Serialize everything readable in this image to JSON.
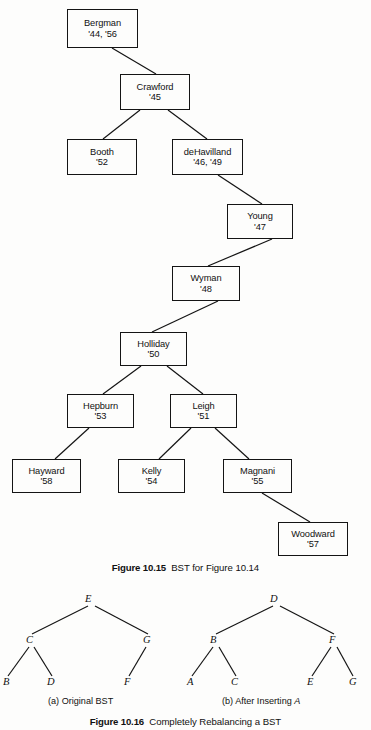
{
  "page": {
    "background_color": "#fdfdfc",
    "ink_color": "#141414",
    "width": 371,
    "height": 730
  },
  "figure_10_15": {
    "caption_label": "Figure 10.15",
    "caption_text": "BST for Figure 10.14",
    "nodes": [
      {
        "id": "bergman",
        "name": "Bergman",
        "years": "'44, '56",
        "x": 67,
        "y": 9,
        "w": 71,
        "h": 39
      },
      {
        "id": "crawford",
        "name": "Crawford",
        "years": "'45",
        "x": 120,
        "y": 74,
        "w": 70,
        "h": 36
      },
      {
        "id": "booth",
        "name": "Booth",
        "years": "'52",
        "x": 67,
        "y": 139,
        "w": 70,
        "h": 36
      },
      {
        "id": "dehavilland",
        "name": "deHavilland",
        "years": "'46, '49",
        "x": 172,
        "y": 139,
        "w": 71,
        "h": 36
      },
      {
        "id": "young",
        "name": "Young",
        "years": "'47",
        "x": 227,
        "y": 204,
        "w": 66,
        "h": 35
      },
      {
        "id": "wyman",
        "name": "Wyman",
        "years": "'48",
        "x": 172,
        "y": 266,
        "w": 68,
        "h": 35
      },
      {
        "id": "holliday",
        "name": "Holliday",
        "years": "'50",
        "x": 120,
        "y": 332,
        "w": 67,
        "h": 34
      },
      {
        "id": "hepburn",
        "name": "Hepburn",
        "years": "'53",
        "x": 67,
        "y": 394,
        "w": 67,
        "h": 34
      },
      {
        "id": "leigh",
        "name": "Leigh",
        "years": "'51",
        "x": 170,
        "y": 394,
        "w": 67,
        "h": 34
      },
      {
        "id": "hayward",
        "name": "Hayward",
        "years": "'58",
        "x": 12,
        "y": 459,
        "w": 69,
        "h": 34
      },
      {
        "id": "kelly",
        "name": "Kelly",
        "years": "'54",
        "x": 118,
        "y": 459,
        "w": 67,
        "h": 34
      },
      {
        "id": "magnani",
        "name": "Magnani",
        "years": "'55",
        "x": 223,
        "y": 459,
        "w": 69,
        "h": 34
      },
      {
        "id": "woodward",
        "name": "Woodward",
        "years": "'57",
        "x": 278,
        "y": 522,
        "w": 70,
        "h": 34
      }
    ],
    "edges": [
      {
        "from": "bergman",
        "to": "crawford",
        "x1": 112,
        "y1": 48,
        "x2": 156,
        "y2": 74
      },
      {
        "from": "crawford",
        "to": "booth",
        "x1": 140,
        "y1": 110,
        "x2": 103,
        "y2": 139
      },
      {
        "from": "crawford",
        "to": "dehavilland",
        "x1": 168,
        "y1": 110,
        "x2": 207,
        "y2": 139
      },
      {
        "from": "dehavilland",
        "to": "young",
        "x1": 218,
        "y1": 175,
        "x2": 262,
        "y2": 204
      },
      {
        "from": "young",
        "to": "wyman",
        "x1": 272,
        "y1": 239,
        "x2": 208,
        "y2": 266
      },
      {
        "from": "wyman",
        "to": "holliday",
        "x1": 218,
        "y1": 301,
        "x2": 152,
        "y2": 332
      },
      {
        "from": "holliday",
        "to": "hepburn",
        "x1": 141,
        "y1": 366,
        "x2": 103,
        "y2": 394
      },
      {
        "from": "holliday",
        "to": "leigh",
        "x1": 167,
        "y1": 366,
        "x2": 203,
        "y2": 394
      },
      {
        "from": "hepburn",
        "to": "hayward",
        "x1": 89,
        "y1": 428,
        "x2": 55,
        "y2": 459
      },
      {
        "from": "leigh",
        "to": "kelly",
        "x1": 191,
        "y1": 428,
        "x2": 159,
        "y2": 459
      },
      {
        "from": "leigh",
        "to": "magnani",
        "x1": 215,
        "y1": 428,
        "x2": 249,
        "y2": 459
      },
      {
        "from": "magnani",
        "to": "woodward",
        "x1": 262,
        "y1": 493,
        "x2": 310,
        "y2": 522
      }
    ]
  },
  "figure_10_16": {
    "caption_label": "Figure 10.16",
    "caption_text": "Completely Rebalancing a BST",
    "subfigures": [
      {
        "id": "a",
        "caption_prefix": "(a) Original BST",
        "caption_italic": "",
        "caption_x": 48,
        "caption_y": 696,
        "nodes": [
          {
            "id": "a-e",
            "label": "E",
            "x": 85,
            "y": 593
          },
          {
            "id": "a-c",
            "label": "C",
            "x": 26,
            "y": 634
          },
          {
            "id": "a-g",
            "label": "G",
            "x": 143,
            "y": 634
          },
          {
            "id": "a-b",
            "label": "B",
            "x": 3,
            "y": 676
          },
          {
            "id": "a-d",
            "label": "D",
            "x": 47,
            "y": 676
          },
          {
            "id": "a-f",
            "label": "F",
            "x": 124,
            "y": 676
          }
        ],
        "edges": [
          {
            "x1": 88,
            "y1": 606,
            "x2": 32,
            "y2": 634
          },
          {
            "x1": 95,
            "y1": 606,
            "x2": 148,
            "y2": 634
          },
          {
            "x1": 29,
            "y1": 647,
            "x2": 8,
            "y2": 676
          },
          {
            "x1": 34,
            "y1": 647,
            "x2": 52,
            "y2": 676
          },
          {
            "x1": 146,
            "y1": 647,
            "x2": 129,
            "y2": 676
          }
        ]
      },
      {
        "id": "b",
        "caption_prefix": "(b) After Inserting ",
        "caption_italic": "A",
        "caption_x": 222,
        "caption_y": 696,
        "nodes": [
          {
            "id": "b-d",
            "label": "D",
            "x": 270,
            "y": 593
          },
          {
            "id": "b-b",
            "label": "B",
            "x": 210,
            "y": 634
          },
          {
            "id": "b-f",
            "label": "F",
            "x": 329,
            "y": 634
          },
          {
            "id": "b-a",
            "label": "A",
            "x": 187,
            "y": 676
          },
          {
            "id": "b-c",
            "label": "C",
            "x": 231,
            "y": 676
          },
          {
            "id": "b-e",
            "label": "E",
            "x": 307,
            "y": 676
          },
          {
            "id": "b-g",
            "label": "G",
            "x": 349,
            "y": 676
          }
        ],
        "edges": [
          {
            "x1": 273,
            "y1": 606,
            "x2": 216,
            "y2": 634
          },
          {
            "x1": 280,
            "y1": 606,
            "x2": 334,
            "y2": 634
          },
          {
            "x1": 213,
            "y1": 647,
            "x2": 192,
            "y2": 676
          },
          {
            "x1": 219,
            "y1": 647,
            "x2": 236,
            "y2": 676
          },
          {
            "x1": 331,
            "y1": 647,
            "x2": 312,
            "y2": 676
          },
          {
            "x1": 337,
            "y1": 647,
            "x2": 353,
            "y2": 676
          }
        ]
      }
    ]
  },
  "captions": {
    "fig15_y": 562,
    "fig16_y": 716
  }
}
